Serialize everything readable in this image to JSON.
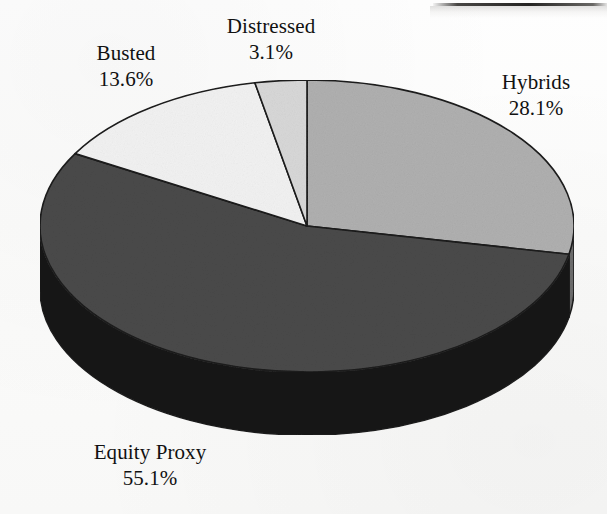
{
  "figure": {
    "background_color": "#fdfdfc",
    "ink_color": "#111111"
  },
  "chart_data": {
    "type": "pie",
    "title": "",
    "subtitle": "",
    "xlabel": "",
    "ylabel": "",
    "grid": false,
    "legend_position": "none",
    "three_d": true,
    "start_angle_deg": -90,
    "direction": "clockwise",
    "units": "percent",
    "total": 99.9,
    "categories": [
      "Hybrids",
      "Equity Proxy",
      "Busted",
      "Distressed"
    ],
    "values": [
      28.1,
      55.1,
      13.6,
      3.1
    ],
    "value_labels": [
      "28.1%",
      "55.1%",
      "13.6%",
      "3.1%"
    ],
    "slice_colors": [
      "#b0b0b0",
      "#4a4a4a",
      "#f2f2f2",
      "#d8d8d8"
    ],
    "slice_side_colors": [
      "#6d6d6d",
      "#141414",
      "#9a9a9a",
      "#8a8a8a"
    ],
    "slices": [
      {
        "name": "Hybrids",
        "value": 28.1,
        "label": "Hybrids",
        "value_label": "28.1%",
        "color": "#b0b0b0",
        "side_color": "#6d6d6d",
        "start_deg": -90.0,
        "end_deg": 11.16
      },
      {
        "name": "Equity Proxy",
        "value": 55.1,
        "label": "Equity Proxy",
        "value_label": "55.1%",
        "color": "#4a4a4a",
        "side_color": "#141414",
        "start_deg": 11.16,
        "end_deg": 209.72
      },
      {
        "name": "Busted",
        "value": 13.6,
        "label": "Busted",
        "value_label": "13.6%",
        "color": "#f2f2f2",
        "side_color": "#9a9a9a",
        "start_deg": 209.72,
        "end_deg": 258.74
      },
      {
        "name": "Distressed",
        "value": 3.1,
        "label": "Distressed",
        "value_label": "3.1%",
        "color": "#d8d8d8",
        "side_color": "#8a8a8a",
        "start_deg": 258.74,
        "end_deg": 270.0
      }
    ]
  },
  "labels": {
    "distressed": {
      "name": "Distressed",
      "value": "3.1%"
    },
    "busted": {
      "name": "Busted",
      "value": "13.6%"
    },
    "hybrids": {
      "name": "Hybrids",
      "value": "28.1%"
    },
    "equity_proxy": {
      "name": "Equity Proxy",
      "value": "55.1%"
    }
  }
}
